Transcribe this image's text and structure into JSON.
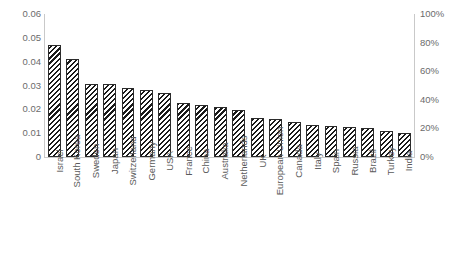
{
  "chart_data": {
    "type": "bar",
    "title": "",
    "subtitle": "",
    "xlabel": "",
    "ylabel": "",
    "grid": false,
    "legend": "none",
    "categories": [
      "Israel",
      "South Korea",
      "Sweden",
      "Japan",
      "Switzerland",
      "Germany",
      "USA",
      "France",
      "China",
      "Australia",
      "Netherlands",
      "UK",
      "European Union",
      "Canada",
      "Italy",
      "Spain",
      "Russia",
      "Brazil",
      "Turkey",
      "India"
    ],
    "values": [
      0.047,
      0.041,
      0.0305,
      0.0305,
      0.029,
      0.028,
      0.027,
      0.0228,
      0.022,
      0.021,
      0.0198,
      0.0165,
      0.016,
      0.0148,
      0.0135,
      0.0131,
      0.0126,
      0.0122,
      0.011,
      0.0101
    ],
    "series": [
      {
        "name": "R&D intensity",
        "values": [
          0.047,
          0.041,
          0.0305,
          0.0305,
          0.029,
          0.028,
          0.027,
          0.0228,
          0.022,
          0.021,
          0.0198,
          0.0165,
          0.016,
          0.0148,
          0.0135,
          0.0131,
          0.0126,
          0.0122,
          0.011,
          0.0101
        ]
      }
    ],
    "ylim": [
      0,
      0.06
    ],
    "y_ticks_left": [
      "0",
      "0.01",
      "0.02",
      "0.03",
      "0.04",
      "0.05",
      "0.06"
    ],
    "y_tick_values_left": [
      0,
      0.01,
      0.02,
      0.03,
      0.04,
      0.05,
      0.06
    ],
    "ylim_right": [
      0,
      1
    ],
    "y_ticks_right": [
      "0%",
      "20%",
      "40%",
      "60%",
      "80%",
      "100%"
    ],
    "y_tick_values_right": [
      0,
      0.2,
      0.4,
      0.6,
      0.8,
      1.0
    ],
    "bar_style": "diagonal-hatch",
    "bar_color": "#1a1a1a",
    "axis_color": "#c9c9c9",
    "tick_text_color": "#6b6b6b"
  }
}
